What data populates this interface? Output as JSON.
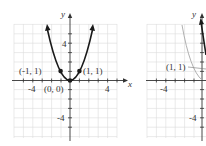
{
  "figures": [
    {
      "name": "left-graph",
      "function": "y = x^2",
      "axis_labels": {
        "x": "x",
        "y": "y"
      },
      "tick_labels": {
        "x_neg": "-4",
        "x_pos": "4",
        "y_pos": "4",
        "y_neg": "-4"
      },
      "points": [
        {
          "label": "(-1, 1)",
          "x": -1,
          "y": 1
        },
        {
          "label": "(0, 0)",
          "x": 0,
          "y": 0
        },
        {
          "label": "(1, 1)",
          "x": 1,
          "y": 1
        }
      ],
      "colors": {
        "curve": "#1a1a1a",
        "grid": "#d8d8d8",
        "axis": "#333333"
      }
    },
    {
      "name": "right-graph",
      "axis_labels": {
        "y": "y"
      },
      "tick_labels": {
        "x_neg": "-4",
        "y_neg": "-4"
      },
      "points": [
        {
          "label": "(1, 1)",
          "x": 1,
          "y": 1
        }
      ],
      "colors": {
        "reflected_curve": "#aaaaaa",
        "curve": "#1a1a1a",
        "grid": "#d8d8d8",
        "axis": "#333333"
      }
    }
  ]
}
